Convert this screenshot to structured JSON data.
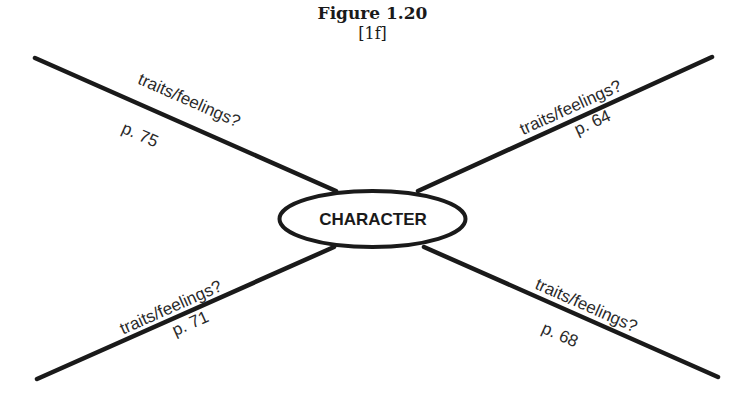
{
  "figure": {
    "title": "Figure 1.20",
    "subtitle": "[1f]"
  },
  "diagram": {
    "type": "web / spider map",
    "center": {
      "label": "CHARACTER"
    },
    "branches": [
      {
        "position": "top-left",
        "label": "traits/feelings?",
        "page": "p. 75"
      },
      {
        "position": "top-right",
        "label": "traits/feelings?",
        "page": "p. 64"
      },
      {
        "position": "bottom-left",
        "label": "traits/feelings?",
        "page": "p. 71"
      },
      {
        "position": "bottom-right",
        "label": "traits/feelings?",
        "page": "p. 68"
      }
    ]
  },
  "colors": {
    "line": "#1a1a1a",
    "background": "#ffffff"
  }
}
